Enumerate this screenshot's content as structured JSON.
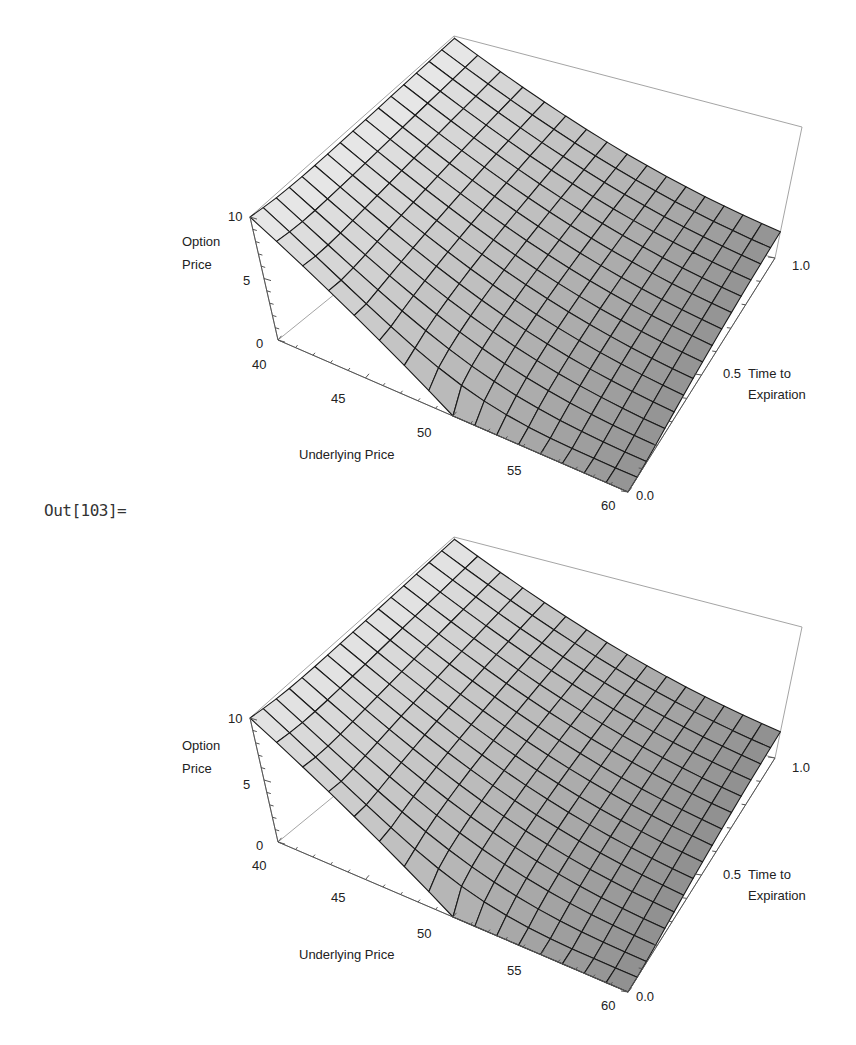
{
  "output_cell": {
    "label": "Out[103]="
  },
  "colors": {
    "mesh": "#1a1a1a",
    "box": "#9a9a9a",
    "axis": "#555555",
    "text": "#222222",
    "surface_light": "#e6e6e6",
    "surface_dark": "#8f8f8f"
  },
  "plots": [
    {
      "id": "plot-1",
      "z_axis_label_line1": "Option",
      "z_axis_label_line2": "Price",
      "x_axis_label": "Underlying Price",
      "y_axis_label_line1": "Time to",
      "y_axis_label_line2": "Expiration",
      "z_ticks": [
        "10",
        "5",
        "0"
      ],
      "x_ticks": [
        "40",
        "45",
        "50",
        "55",
        "60"
      ],
      "y_ticks": [
        "0.0",
        "0.5",
        "1.0"
      ]
    },
    {
      "id": "plot-2",
      "z_axis_label_line1": "Option",
      "z_axis_label_line2": "Price",
      "x_axis_label": "Underlying Price",
      "y_axis_label_line1": "Time to",
      "y_axis_label_line2": "Expiration",
      "z_ticks": [
        "10",
        "5",
        "0"
      ],
      "x_ticks": [
        "40",
        "45",
        "50",
        "55",
        "60"
      ],
      "y_ticks": [
        "0.0",
        "0.5",
        "1.0"
      ]
    }
  ],
  "chart_data": [
    {
      "type": "surface3d",
      "title": "",
      "xlabel": "Underlying Price",
      "ylabel": "Time to Expiration",
      "zlabel": "Option Price",
      "xlim": [
        40,
        60
      ],
      "ylim": [
        0,
        1
      ],
      "zlim": [
        0,
        10
      ],
      "x_ticks": [
        40,
        45,
        50,
        55,
        60
      ],
      "y_ticks": [
        0.0,
        0.5,
        1.0
      ],
      "z_ticks": [
        0,
        5,
        10
      ],
      "mesh_divisions": 16,
      "model": "European put option price (Black-Scholes)",
      "strike": 50,
      "rate": 0.05,
      "volatility": 0.3,
      "sample_values": [
        {
          "S": 40,
          "T": 0.0,
          "V": 10.0
        },
        {
          "S": 50,
          "T": 0.0,
          "V": 0.0
        },
        {
          "S": 60,
          "T": 0.0,
          "V": 0.0
        },
        {
          "S": 40,
          "T": 1.0,
          "V": 10.6
        },
        {
          "S": 50,
          "T": 1.0,
          "V": 4.7
        },
        {
          "S": 60,
          "T": 1.0,
          "V": 1.9
        }
      ]
    },
    {
      "type": "surface3d",
      "title": "",
      "xlabel": "Underlying Price",
      "ylabel": "Time to Expiration",
      "zlabel": "Option Price",
      "xlim": [
        40,
        60
      ],
      "ylim": [
        0,
        1
      ],
      "zlim": [
        0,
        10
      ],
      "x_ticks": [
        40,
        45,
        50,
        55,
        60
      ],
      "y_ticks": [
        0.0,
        0.5,
        1.0
      ],
      "z_ticks": [
        0,
        5,
        10
      ],
      "mesh_divisions": 16,
      "model": "European put option price (numerical approximation)",
      "strike": 50,
      "rate": 0.05,
      "volatility": 0.3
    }
  ]
}
